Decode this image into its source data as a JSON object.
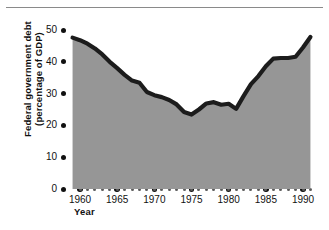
{
  "figure": {
    "name": "federal-government-debt-chart",
    "x_axis_title": "Year",
    "y_axis_title_line1": "Federal government debt",
    "y_axis_title_line2": "(percentage of GDP)"
  },
  "chart_data": {
    "type": "area",
    "title": "",
    "subtitle": "",
    "xlabel": "Year",
    "ylabel": "Federal government debt (percentage of GDP)",
    "xlim": [
      1959,
      1991
    ],
    "ylim": [
      0,
      50
    ],
    "grid": false,
    "legend": null,
    "series_color": "#1c1c1c",
    "fill_color": "#969696",
    "x_major_ticks": [
      1960,
      1965,
      1970,
      1975,
      1980,
      1985,
      1990
    ],
    "y_major_ticks": [
      0,
      10,
      20,
      30,
      40,
      50
    ],
    "x_tick_labels": [
      "1960",
      "1965",
      "1970",
      "1975",
      "1980",
      "1985",
      "1990"
    ],
    "y_tick_labels": [
      "0",
      "10",
      "20",
      "30",
      "40",
      "50"
    ],
    "x_minor_tick_interval": 1,
    "x": [
      1959,
      1960,
      1961,
      1962,
      1963,
      1964,
      1965,
      1966,
      1967,
      1968,
      1969,
      1970,
      1971,
      1972,
      1973,
      1974,
      1975,
      1976,
      1977,
      1978,
      1979,
      1980,
      1981,
      1982,
      1983,
      1984,
      1985,
      1986,
      1987,
      1988,
      1989,
      1990,
      1991
    ],
    "values": [
      47.6,
      46.8,
      45.7,
      44.2,
      42.3,
      40.0,
      38.0,
      35.9,
      34.1,
      33.4,
      30.5,
      29.5,
      28.9,
      28.0,
      26.6,
      24.2,
      23.4,
      25.0,
      26.9,
      27.3,
      26.5,
      26.8,
      25.2,
      29.2,
      33.0,
      35.5,
      38.6,
      41.0,
      41.2,
      41.2,
      41.6,
      44.5,
      47.8
    ],
    "notes": {
      "peak_start": 47.6,
      "minimum": 23.4,
      "minimum_year": 1975,
      "peak_end": 47.8,
      "peak_end_year": 1991
    }
  },
  "axes": {
    "y_ticks": [
      {
        "label": "50",
        "value": 50
      },
      {
        "label": "40",
        "value": 40
      },
      {
        "label": "30",
        "value": 30
      },
      {
        "label": "20",
        "value": 20
      },
      {
        "label": "10",
        "value": 10
      },
      {
        "label": "0",
        "value": 0
      }
    ],
    "x_ticks": [
      {
        "label": "1960",
        "value": 1960
      },
      {
        "label": "1965",
        "value": 1965
      },
      {
        "label": "1970",
        "value": 1970
      },
      {
        "label": "1975",
        "value": 1975
      },
      {
        "label": "1980",
        "value": 1980
      },
      {
        "label": "1985",
        "value": 1985
      },
      {
        "label": "1990",
        "value": 1990
      }
    ]
  }
}
